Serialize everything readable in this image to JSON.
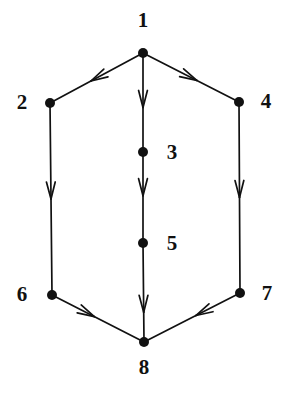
{
  "figure": {
    "width": 290,
    "height": 402,
    "background_color": "#ffffff",
    "ink_color": "#111111"
  },
  "graph": {
    "type": "directed-graph",
    "node_radius": 5,
    "edge_width": 1.7,
    "arrow_style": "open-barb",
    "nodes": [
      {
        "id": "1",
        "label": "1",
        "x": 143,
        "y": 53,
        "label_x": 143,
        "label_y": 20,
        "label_pos": "above"
      },
      {
        "id": "2",
        "label": "2",
        "x": 50,
        "y": 103,
        "label_x": 22,
        "label_y": 102,
        "label_pos": "left"
      },
      {
        "id": "3",
        "label": "3",
        "x": 143,
        "y": 152,
        "label_x": 172,
        "label_y": 152,
        "label_pos": "right"
      },
      {
        "id": "4",
        "label": "4",
        "x": 239,
        "y": 102,
        "label_x": 266,
        "label_y": 101,
        "label_pos": "right"
      },
      {
        "id": "5",
        "label": "5",
        "x": 143,
        "y": 243,
        "label_x": 172,
        "label_y": 243,
        "label_pos": "right"
      },
      {
        "id": "6",
        "label": "6",
        "x": 52,
        "y": 295,
        "label_x": 22,
        "label_y": 294,
        "label_pos": "left"
      },
      {
        "id": "7",
        "label": "7",
        "x": 240,
        "y": 293,
        "label_x": 267,
        "label_y": 293,
        "label_pos": "right"
      },
      {
        "id": "8",
        "label": "8",
        "x": 144,
        "y": 342,
        "label_x": 144,
        "label_y": 367,
        "label_pos": "below"
      }
    ],
    "edges": [
      {
        "from": "1",
        "to": "2",
        "arrow_t": 0.56,
        "direction": "down-left"
      },
      {
        "from": "1",
        "to": "3",
        "arrow_t": 0.55,
        "direction": "down"
      },
      {
        "from": "1",
        "to": "4",
        "arrow_t": 0.56,
        "direction": "down-right"
      },
      {
        "from": "2",
        "to": "6",
        "arrow_t": 0.5,
        "direction": "down"
      },
      {
        "from": "3",
        "to": "5",
        "arrow_t": 0.48,
        "direction": "down"
      },
      {
        "from": "4",
        "to": "7",
        "arrow_t": 0.5,
        "direction": "down"
      },
      {
        "from": "5",
        "to": "8",
        "arrow_t": 0.7,
        "direction": "down"
      },
      {
        "from": "6",
        "to": "8",
        "arrow_t": 0.46,
        "direction": "down-right"
      },
      {
        "from": "7",
        "to": "8",
        "arrow_t": 0.46,
        "direction": "down-left"
      }
    ]
  }
}
